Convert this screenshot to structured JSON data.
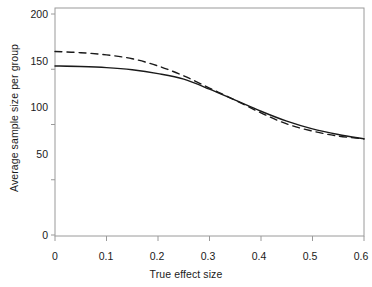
{
  "chart_data": {
    "type": "line",
    "title": "",
    "xlabel": "True effect size",
    "ylabel": "Average sample size per group",
    "xlim": [
      0,
      0.6
    ],
    "ylim": [
      0,
      200
    ],
    "xticks": [
      0,
      0.1,
      0.2,
      0.3,
      0.4,
      0.5,
      0.6
    ],
    "xtick_labels": [
      "0",
      "0.1",
      "0.2",
      "0.3",
      "0.4",
      "0.5",
      "0.6"
    ],
    "yticks": [
      0,
      50,
      100,
      150,
      200
    ],
    "ytick_labels": [
      "0",
      "50",
      "100",
      "150",
      "200"
    ],
    "grid": false,
    "legend": "none",
    "box": true,
    "series": [
      {
        "name": "solid",
        "style": "solid",
        "color": "#1a1a1a",
        "x": [
          0.0,
          0.05,
          0.1,
          0.15,
          0.2,
          0.25,
          0.3,
          0.35,
          0.4,
          0.45,
          0.5,
          0.55,
          0.6
        ],
        "values": [
          153,
          152.5,
          151.5,
          149.5,
          146,
          141,
          132,
          122,
          112,
          103,
          96,
          91,
          87
        ]
      },
      {
        "name": "dashed",
        "style": "dashed",
        "color": "#1a1a1a",
        "x": [
          0.0,
          0.05,
          0.1,
          0.15,
          0.2,
          0.25,
          0.3,
          0.35,
          0.4,
          0.45,
          0.5,
          0.55,
          0.6
        ],
        "values": [
          166,
          165,
          163,
          159.5,
          153,
          144,
          133,
          122,
          110.5,
          100.5,
          94,
          89.5,
          87
        ]
      }
    ]
  }
}
